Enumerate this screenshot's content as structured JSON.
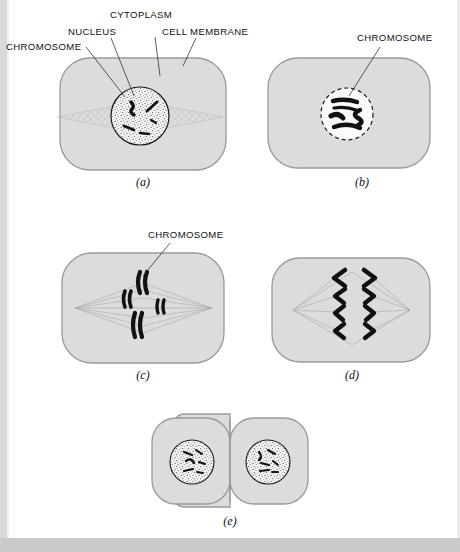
{
  "figure": {
    "colors": {
      "cell_fill": "#dcdcdc",
      "cell_stroke": "#9a9a9a",
      "nucleus_fill": "#f2f2f2",
      "nucleus_stroke": "#1a1a1a",
      "chromosome": "#111111",
      "spindle": "#b0b0b0",
      "label_text": "#111111",
      "leader_line": "#333333",
      "page_background": "#ffffff",
      "page_edge": "#d9d9d9"
    },
    "panels": [
      {
        "id": "a",
        "letter": "(a)",
        "stage_description": "Interphase / early prophase: intact nucleus with stippled nucleoplasm, chromatin threads, faint spindle forming across the cytoplasm",
        "labels": [
          {
            "name": "chromosome",
            "text": "CHROMOSOME"
          },
          {
            "name": "nucleus",
            "text": "NUCLEUS"
          },
          {
            "name": "cytoplasm",
            "text": "CYTOPLASM"
          },
          {
            "name": "cell-membrane",
            "text": "CELL MEMBRANE"
          }
        ],
        "chromosome_count": 5,
        "nucleus_visible": true,
        "nucleus_dashed": false,
        "spindle_visible": true
      },
      {
        "id": "b",
        "letter": "(b)",
        "stage_description": "Prophase: nuclear envelope breaking down (dashed), chromosomes condensed and thickened",
        "labels": [
          {
            "name": "chromosome",
            "text": "CHROMOSOME"
          }
        ],
        "chromosome_count": 4,
        "nucleus_visible": true,
        "nucleus_dashed": true,
        "spindle_visible": false
      },
      {
        "id": "c",
        "letter": "(c)",
        "stage_description": "Metaphase: paired sister chromatids aligned near the equator, spindle fibers span pole to pole",
        "labels": [
          {
            "name": "chromosome",
            "text": "CHROMOSOME"
          }
        ],
        "chromosome_count": 4,
        "nucleus_visible": false,
        "nucleus_dashed": false,
        "spindle_visible": true
      },
      {
        "id": "d",
        "letter": "(d)",
        "stage_description": "Anaphase: V-shaped chromatids pulled toward opposite poles, four on each side",
        "labels": [],
        "chromosome_count": 8,
        "nucleus_visible": false,
        "nucleus_dashed": false,
        "spindle_visible": true
      },
      {
        "id": "e",
        "letter": "(e)",
        "stage_description": "Telophase / cytokinesis: two daughter cells each with a re-formed stippled nucleus containing chromatin",
        "labels": [],
        "chromosome_count": 10,
        "nucleus_visible": true,
        "nucleus_dashed": false,
        "spindle_visible": false
      }
    ]
  }
}
